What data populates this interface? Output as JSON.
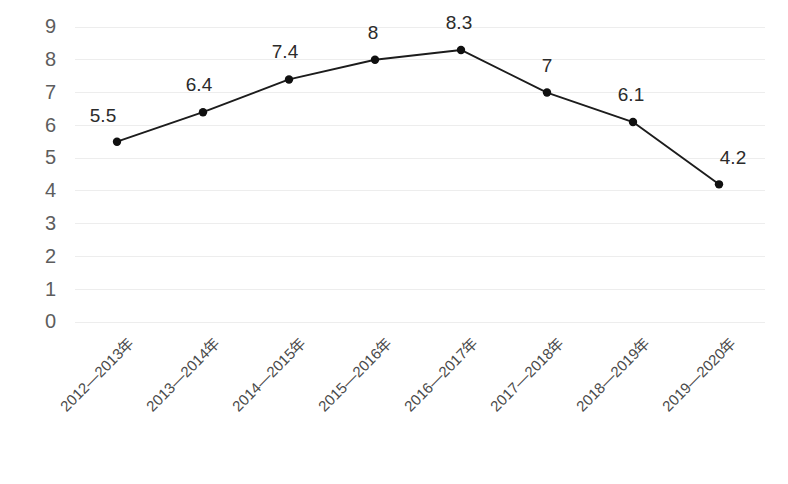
{
  "chart_data": {
    "type": "line",
    "title": "",
    "subtitle": "",
    "xlabel": "",
    "ylabel": "",
    "categories": [
      "2012—2013年",
      "2013—2014年",
      "2014—2015年",
      "2015—2016年",
      "2016—2017年",
      "2017—2018年",
      "2018—2019年",
      "2019—2020年"
    ],
    "values": [
      5.5,
      6.4,
      7.4,
      8,
      8.3,
      7,
      6.1,
      4.2
    ],
    "point_labels": [
      "5.5",
      "6.4",
      "7.4",
      "8",
      "8.3",
      "7",
      "6.1",
      "4.2"
    ],
    "ylim": [
      0,
      9
    ],
    "ytick_labels": [
      "0",
      "1",
      "2",
      "3",
      "4",
      "5",
      "6",
      "7",
      "8",
      "9"
    ],
    "ytick_values": [
      0,
      1,
      2,
      3,
      4,
      5,
      6,
      7,
      8,
      9
    ],
    "grid": true,
    "grid_axis": "y",
    "legend": false,
    "legend_position": "none",
    "markers": true,
    "xtick_rotation_deg": 45,
    "colors": {
      "background": "#ffffff",
      "line": "#1c1c1c",
      "marker": "#101010",
      "gridline": "#ededed",
      "ytick_text": "#5d5d5d",
      "xtick_text": "#4a4a4a",
      "data_label_text": "#2b2b2b"
    }
  },
  "footer": {
    "cropped_text": ""
  }
}
